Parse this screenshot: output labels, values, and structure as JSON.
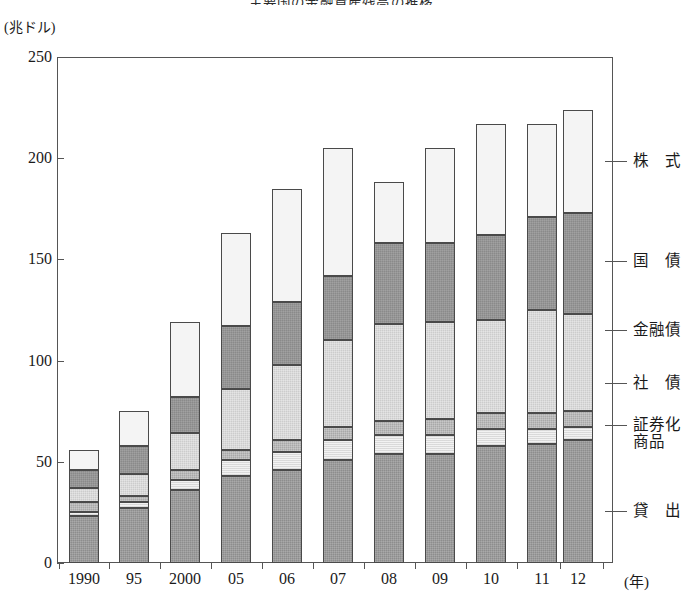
{
  "title": "主要国の金融資産残高の推移",
  "axes": {
    "y_unit": "(兆ドル)",
    "y_ticks": [
      "0",
      "50",
      "100",
      "150",
      "200",
      "250"
    ],
    "x_unit": "(年)",
    "x_ticks": [
      "1990",
      "95",
      "2000",
      "05",
      "06",
      "07",
      "08",
      "09",
      "10",
      "11",
      "12"
    ]
  },
  "legend": [
    {
      "key": "stock",
      "label": "株　式",
      "color": "#f4f4f4"
    },
    {
      "key": "govt",
      "label": "国　債",
      "color": "#8a8a8a"
    },
    {
      "key": "fin",
      "label": "金融債",
      "color": "#cccccc"
    },
    {
      "key": "corp",
      "label": "社　債",
      "color": "#a8a8a8"
    },
    {
      "key": "secz",
      "label": "証券化",
      "label2": "商品",
      "color": "#f2f2f2"
    },
    {
      "key": "loan",
      "label": "貸　出",
      "color": "#8d8d8d"
    }
  ],
  "chart_data": {
    "type": "bar",
    "subtype": "stacked-vertical",
    "title": "主要国の金融資産残高の推移",
    "xlabel": "(年)",
    "ylabel": "(兆ドル)",
    "ylim": [
      0,
      250
    ],
    "ytick_step": 50,
    "grid": false,
    "legend_position": "right",
    "categories": [
      "1990",
      "95",
      "2000",
      "05",
      "06",
      "07",
      "08",
      "09",
      "10",
      "11",
      "12"
    ],
    "series": [
      {
        "name": "貸出",
        "values": [
          23,
          27,
          36,
          43,
          46,
          51,
          54,
          54,
          58,
          59,
          61
        ]
      },
      {
        "name": "証券化商品",
        "values": [
          2,
          3,
          5,
          8,
          9,
          10,
          9,
          9,
          8,
          7,
          6
        ]
      },
      {
        "name": "社債",
        "values": [
          5,
          3,
          5,
          5,
          6,
          6,
          7,
          8,
          8,
          8,
          8
        ]
      },
      {
        "name": "金融債",
        "values": [
          7,
          11,
          18,
          30,
          37,
          43,
          48,
          48,
          46,
          51,
          48
        ]
      },
      {
        "name": "国債",
        "values": [
          9,
          14,
          18,
          31,
          31,
          32,
          40,
          39,
          42,
          46,
          50
        ]
      },
      {
        "name": "株式",
        "values": [
          10,
          17,
          37,
          46,
          56,
          63,
          30,
          47,
          55,
          46,
          51
        ]
      }
    ],
    "totals": [
      56,
      75,
      119,
      163,
      185,
      205,
      188,
      205,
      217,
      217,
      224
    ]
  },
  "plot": {
    "left": 57,
    "top": 57,
    "width": 556,
    "height": 506,
    "bar_width": 30,
    "bar_centers": [
      84,
      134,
      185,
      236,
      287,
      338,
      389,
      440,
      491,
      542,
      578
    ]
  }
}
